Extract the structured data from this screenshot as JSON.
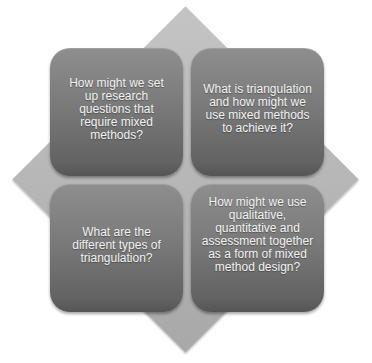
{
  "diagram": {
    "type": "four-quadrant matrix on diamond background",
    "colors": {
      "diamond": "#b8b8b8",
      "box_top": "#8e8e8e",
      "box_bottom": "#555555",
      "text": "#f2f2f2"
    },
    "quadrants": [
      {
        "position": "top-left",
        "text": "How might we set up research questions that require mixed methods?"
      },
      {
        "position": "top-right",
        "text": "What is triangulation and how might we use mixed methods to achieve it?"
      },
      {
        "position": "bottom-left",
        "text": "What are the different types of triangulation?"
      },
      {
        "position": "bottom-right",
        "text": "How might we use qualitative, quantitative and assessment together as a form of mixed method design?"
      }
    ]
  }
}
